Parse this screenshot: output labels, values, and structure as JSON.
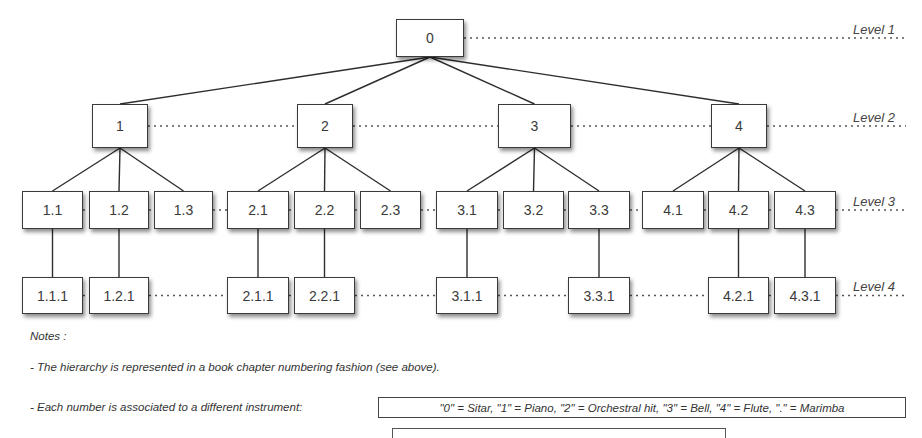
{
  "diagram": {
    "levels": [
      {
        "label": "Level 1",
        "y": 38
      },
      {
        "label": "Level 2",
        "y": 126
      },
      {
        "label": "Level 3",
        "y": 210
      },
      {
        "label": "Level 4",
        "y": 295
      }
    ],
    "nodes": [
      {
        "id": "0",
        "label": "0",
        "level": 1,
        "x": 396,
        "y": 19,
        "w": 68,
        "h": 38
      },
      {
        "id": "1",
        "label": "1",
        "level": 2,
        "x": 92,
        "y": 104,
        "w": 56,
        "h": 44
      },
      {
        "id": "2",
        "label": "2",
        "level": 2,
        "x": 297,
        "y": 104,
        "w": 56,
        "h": 44
      },
      {
        "id": "3",
        "label": "3",
        "level": 2,
        "x": 498,
        "y": 104,
        "w": 73,
        "h": 44
      },
      {
        "id": "4",
        "label": "4",
        "level": 2,
        "x": 711,
        "y": 104,
        "w": 56,
        "h": 44
      },
      {
        "id": "1.1",
        "label": "1.1",
        "level": 3,
        "x": 22,
        "y": 191,
        "w": 61,
        "h": 38
      },
      {
        "id": "1.2",
        "label": "1.2",
        "level": 3,
        "x": 89,
        "y": 191,
        "w": 60,
        "h": 38
      },
      {
        "id": "1.3",
        "label": "1.3",
        "level": 3,
        "x": 154,
        "y": 191,
        "w": 59,
        "h": 38
      },
      {
        "id": "2.1",
        "label": "2.1",
        "level": 3,
        "x": 227,
        "y": 191,
        "w": 62,
        "h": 38
      },
      {
        "id": "2.2",
        "label": "2.2",
        "level": 3,
        "x": 294,
        "y": 191,
        "w": 61,
        "h": 38
      },
      {
        "id": "2.3",
        "label": "2.3",
        "level": 3,
        "x": 360,
        "y": 191,
        "w": 61,
        "h": 38
      },
      {
        "id": "3.1",
        "label": "3.1",
        "level": 3,
        "x": 436,
        "y": 191,
        "w": 62,
        "h": 38
      },
      {
        "id": "3.2",
        "label": "3.2",
        "level": 3,
        "x": 503,
        "y": 191,
        "w": 61,
        "h": 38
      },
      {
        "id": "3.3",
        "label": "3.3",
        "level": 3,
        "x": 568,
        "y": 191,
        "w": 62,
        "h": 38
      },
      {
        "id": "4.1",
        "label": "4.1",
        "level": 3,
        "x": 642,
        "y": 191,
        "w": 62,
        "h": 38
      },
      {
        "id": "4.2",
        "label": "4.2",
        "level": 3,
        "x": 708,
        "y": 191,
        "w": 61,
        "h": 38
      },
      {
        "id": "4.3",
        "label": "4.3",
        "level": 3,
        "x": 774,
        "y": 191,
        "w": 62,
        "h": 38
      },
      {
        "id": "1.1.1",
        "label": "1.1.1",
        "level": 4,
        "x": 22,
        "y": 277,
        "w": 61,
        "h": 37
      },
      {
        "id": "1.2.1",
        "label": "1.2.1",
        "level": 4,
        "x": 89,
        "y": 277,
        "w": 60,
        "h": 37
      },
      {
        "id": "2.1.1",
        "label": "2.1.1",
        "level": 4,
        "x": 227,
        "y": 277,
        "w": 62,
        "h": 37
      },
      {
        "id": "2.2.1",
        "label": "2.2.1",
        "level": 4,
        "x": 294,
        "y": 277,
        "w": 61,
        "h": 37
      },
      {
        "id": "3.1.1",
        "label": "3.1.1",
        "level": 4,
        "x": 436,
        "y": 277,
        "w": 62,
        "h": 37
      },
      {
        "id": "3.3.1",
        "label": "3.3.1",
        "level": 4,
        "x": 568,
        "y": 277,
        "w": 62,
        "h": 37
      },
      {
        "id": "4.2.1",
        "label": "4.2.1",
        "level": 4,
        "x": 708,
        "y": 277,
        "w": 61,
        "h": 37
      },
      {
        "id": "4.3.1",
        "label": "4.3.1",
        "level": 4,
        "x": 774,
        "y": 277,
        "w": 62,
        "h": 37
      }
    ],
    "edges": [
      [
        "0",
        "1"
      ],
      [
        "0",
        "2"
      ],
      [
        "0",
        "3"
      ],
      [
        "0",
        "4"
      ],
      [
        "1",
        "1.1"
      ],
      [
        "1",
        "1.2"
      ],
      [
        "1",
        "1.3"
      ],
      [
        "2",
        "2.1"
      ],
      [
        "2",
        "2.2"
      ],
      [
        "2",
        "2.3"
      ],
      [
        "3",
        "3.1"
      ],
      [
        "3",
        "3.2"
      ],
      [
        "3",
        "3.3"
      ],
      [
        "4",
        "4.1"
      ],
      [
        "4",
        "4.2"
      ],
      [
        "4",
        "4.3"
      ],
      [
        "1.1",
        "1.1.1"
      ],
      [
        "1.2",
        "1.2.1"
      ],
      [
        "2.1",
        "2.1.1"
      ],
      [
        "2.2",
        "2.2.1"
      ],
      [
        "3.1",
        "3.1.1"
      ],
      [
        "3.3",
        "3.3.1"
      ],
      [
        "4.2",
        "4.2.1"
      ],
      [
        "4.3",
        "4.3.1"
      ]
    ]
  },
  "notes": {
    "title": "Notes :",
    "line1": "- The hierarchy is represented in a book chapter numbering fashion (see above).",
    "line2": "- Each number is associated to a different instrument:",
    "instrument_mapping": "\"0\" = Sitar, \"1\" = Piano, \"2\" = Orchestral hit, \"3\" = Bell, \"4\" = Flute, \".\" = Marimba"
  }
}
